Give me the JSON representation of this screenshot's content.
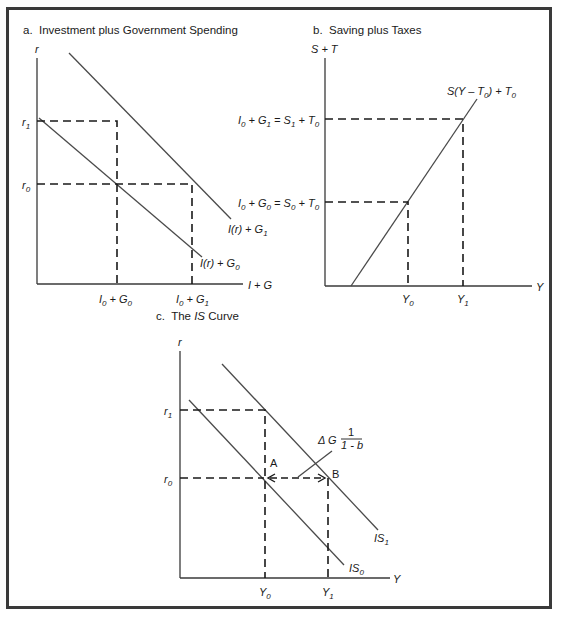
{
  "panels": {
    "a": {
      "title": "a.  Investment plus Government Spending",
      "y_axis": "r",
      "x_axis": "I + G",
      "y_ticks": [
        "r1",
        "r0"
      ],
      "x_ticks": [
        "I0 + G0",
        "I0 + G1"
      ],
      "curves": [
        "I(r) + G1",
        "I(r) + G0"
      ]
    },
    "b": {
      "title": "b.  Saving plus Taxes",
      "y_axis": "S + T",
      "x_axis": "Y",
      "y_ticks": [
        "I0 + G1 = S1 + T0",
        "I0 + G0 = S0 + T0"
      ],
      "x_ticks": [
        "Y0",
        "Y1"
      ],
      "curves": [
        "S(Y - T0) + T0"
      ]
    },
    "c": {
      "title": "c.  The IS Curve",
      "y_axis": "r",
      "x_axis": "Y",
      "y_ticks": [
        "r1",
        "r0"
      ],
      "x_ticks": [
        "Y0",
        "Y1"
      ],
      "curves": [
        "IS1",
        "IS0"
      ],
      "points": [
        "A",
        "B"
      ],
      "annotation": "ΔG 1/(1 - b)"
    }
  }
}
